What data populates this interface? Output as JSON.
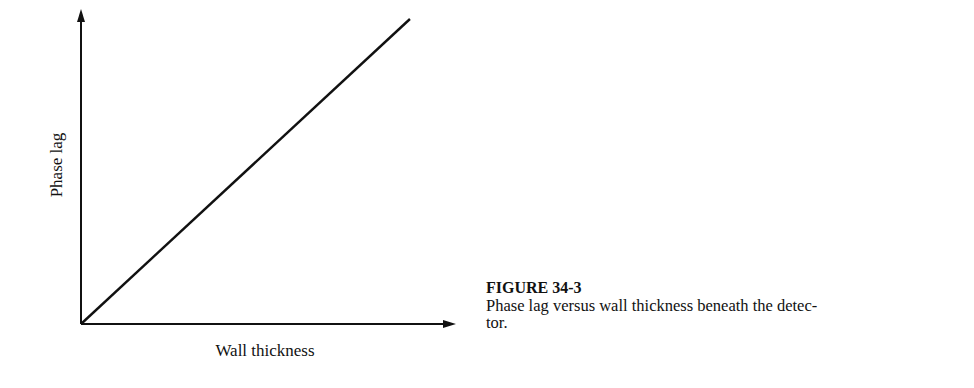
{
  "figure": {
    "number_label": "FIGURE 34-3",
    "caption_line1": "Phase lag versus wall thickness beneath the detec-",
    "caption_line2": "tor.",
    "caption": "Phase lag versus wall thickness beneath the detector."
  },
  "colors": {
    "ink": "#111111",
    "background": "#ffffff"
  },
  "chart_data": {
    "type": "line",
    "title": "",
    "xlabel": "Wall thickness",
    "ylabel": "Phase lag",
    "x_ticks": [],
    "y_ticks": [],
    "grid": false,
    "legend": null,
    "series": [
      {
        "name": "Phase lag vs wall thickness",
        "x": [
          0,
          1
        ],
        "y": [
          0,
          1
        ],
        "relation": "linear, proportional (passes through origin)"
      }
    ],
    "xlim": [
      0,
      1.14
    ],
    "ylim": [
      0,
      1.0
    ],
    "annotations": [],
    "caption": "FIGURE 34-3 Phase lag versus wall thickness beneath the detector."
  }
}
